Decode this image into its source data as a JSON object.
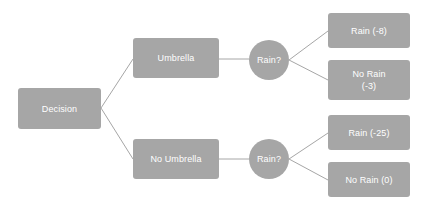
{
  "diagram": {
    "type": "decision-tree",
    "background_color": "#ffffff",
    "node_fill_color": "#a6a6a6",
    "node_text_color": "#ffffff",
    "edge_color": "#a6a6a6",
    "nodes": {
      "decision": {
        "label": "Decision",
        "shape": "rect"
      },
      "umbrella": {
        "label": "Umbrella",
        "shape": "rect"
      },
      "no_umbrella": {
        "label": "No Umbrella",
        "shape": "rect"
      },
      "rain_top": {
        "label": "Rain?",
        "shape": "circle"
      },
      "rain_bottom": {
        "label": "Rain?",
        "shape": "circle"
      },
      "rain_8": {
        "label": "Rain (-8)",
        "shape": "rect",
        "payoff": -8
      },
      "no_rain_3": {
        "label": "No Rain\n(-3)",
        "shape": "rect",
        "payoff": -3
      },
      "rain_25": {
        "label": "Rain (-25)",
        "shape": "rect",
        "payoff": -25
      },
      "no_rain_0": {
        "label": "No Rain (0)",
        "shape": "rect",
        "payoff": 0
      }
    },
    "edges": [
      {
        "from": "decision",
        "to": "umbrella"
      },
      {
        "from": "decision",
        "to": "no_umbrella"
      },
      {
        "from": "umbrella",
        "to": "rain_top"
      },
      {
        "from": "no_umbrella",
        "to": "rain_bottom"
      },
      {
        "from": "rain_top",
        "to": "rain_8"
      },
      {
        "from": "rain_top",
        "to": "no_rain_3"
      },
      {
        "from": "rain_bottom",
        "to": "rain_25"
      },
      {
        "from": "rain_bottom",
        "to": "no_rain_0"
      }
    ]
  }
}
